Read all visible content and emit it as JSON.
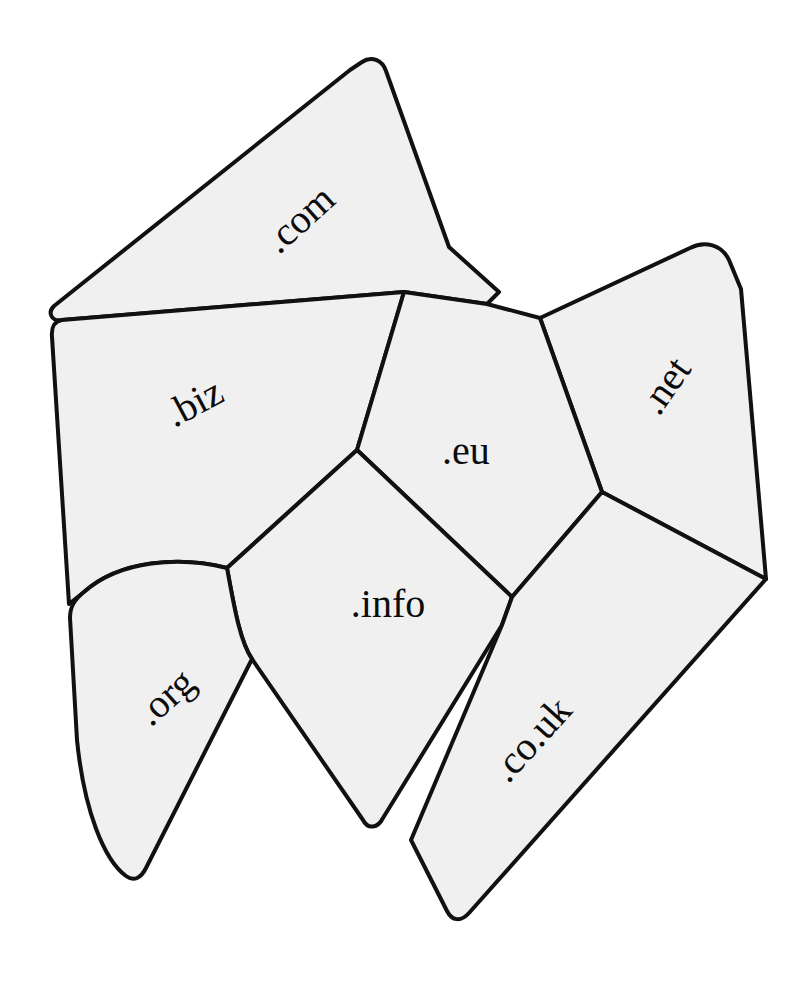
{
  "figure": {
    "kind": "region-map-diagram",
    "background_color": "#ffffff",
    "region_fill_color": "#f0f0f0",
    "region_stroke_color": "#111111",
    "label_color": "#0b0b0b",
    "width": 811,
    "height": 992
  },
  "regions": [
    {
      "id": "com",
      "label": ".com",
      "label_x": 302,
      "label_y": 222,
      "label_rotation": -42,
      "label_size": 44,
      "fill": "#f0f0f0",
      "stroke_width": 4,
      "path": "M 362 62 C 372 55 383 61 386 71 L 449 247 L 499 292 L 487 304 L 404 292 L 62 320 C 52 322 47 313 54 306 L 350 70 Z"
    },
    {
      "id": "biz",
      "label": ".biz",
      "label_x": 196,
      "label_y": 406,
      "label_rotation": -28,
      "label_size": 44,
      "fill": "#f0f0f0",
      "stroke_width": 4,
      "path": "M 62 320 L 404 292 L 357 450 L 227 568 C 180 556 120 560 84 592 L 69 604 L 52 337 C 51 327 55 321 62 320 Z"
    },
    {
      "id": "net",
      "label": ".net",
      "label_x": 668,
      "label_y": 388,
      "label_rotation": -55,
      "label_size": 44,
      "fill": "#f0f0f0",
      "stroke_width": 4,
      "path": "M 540 318 L 690 248 C 705 240 722 245 729 260 L 741 289 L 766 579 L 602 492 Z"
    },
    {
      "id": "eu",
      "label": ".eu",
      "label_x": 466,
      "label_y": 455,
      "label_rotation": 0,
      "label_size": 44,
      "fill": "#f0f0f0",
      "stroke_width": 4,
      "path": "M 404 292 L 487 304 L 540 318 L 602 492 L 512 597 L 357 450 Z"
    },
    {
      "id": "info",
      "label": ".info",
      "label_x": 388,
      "label_y": 608,
      "label_rotation": 0,
      "label_size": 44,
      "fill": "#f0f0f0",
      "stroke_width": 4,
      "path": "M 357 450 L 512 597 L 502 625 L 383 818 C 378 828 368 830 363 820 L 252 659 C 240 642 234 606 227 568 Z"
    },
    {
      "id": "org",
      "label": ".org",
      "label_x": 168,
      "label_y": 700,
      "label_rotation": -42,
      "label_size": 44,
      "fill": "#f0f0f0",
      "stroke_width": 4,
      "path": "M 227 568 C 180 556 120 560 84 592 C 74 600 70 607 70 618 L 77 740 C 84 810 104 860 126 876 C 134 882 141 878 146 868 L 252 659 C 240 642 234 606 227 568 Z"
    },
    {
      "id": "couk",
      "label": ".co.uk",
      "label_x": 534,
      "label_y": 742,
      "label_rotation": -48,
      "label_size": 44,
      "fill": "#f0f0f0",
      "stroke_width": 4,
      "path": "M 512 597 L 602 492 L 766 579 L 469 913 C 461 922 452 921 447 911 L 411 840 L 502 625 Z"
    }
  ]
}
